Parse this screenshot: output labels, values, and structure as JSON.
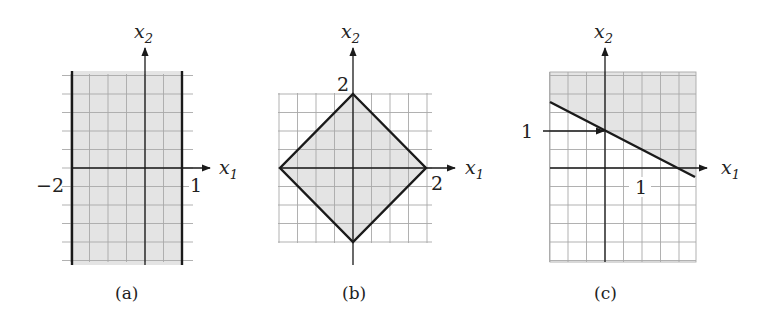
{
  "colors": {
    "shade": "#e4e4e4",
    "grid": "#a8a8a8",
    "ink": "#1a1a1a"
  },
  "grid_step_units": 0.5,
  "panels": [
    {
      "id": "a",
      "caption": "(a)",
      "axis_x_label": "x",
      "axis_x_sub": "1",
      "axis_y_label": "x",
      "axis_y_sub": "2",
      "x_range": [
        -2.25,
        1.25
      ],
      "y_range": [
        -2.6,
        2.65
      ],
      "region": "-2 <= x1 <= 1",
      "tick_labels": [
        {
          "text": "−2",
          "x": -2
        },
        {
          "text": "1",
          "x": 1
        }
      ]
    },
    {
      "id": "b",
      "caption": "(b)",
      "axis_x_label": "x",
      "axis_x_sub": "1",
      "axis_y_label": "x",
      "axis_y_sub": "2",
      "x_range": [
        -2.05,
        2.15
      ],
      "y_range": [
        -2.1,
        2.1
      ],
      "region": "|x1| + |x2| <= 2",
      "tick_labels": [
        {
          "text": "2",
          "axis": "y",
          "value": 2
        },
        {
          "text": "2",
          "axis": "x",
          "value": 2
        }
      ]
    },
    {
      "id": "c",
      "caption": "(c)",
      "axis_x_label": "x",
      "axis_x_sub": "1",
      "axis_y_label": "x",
      "axis_y_sub": "2",
      "x_range": [
        -1.5,
        2.5
      ],
      "y_range": [
        -2.55,
        2.6
      ],
      "region": "x1 + 2*x2 >= 2",
      "tick_labels": [
        {
          "text": "1",
          "axis": "y",
          "value": 1
        },
        {
          "text": "1",
          "axis": "x",
          "value": 1
        }
      ]
    }
  ]
}
